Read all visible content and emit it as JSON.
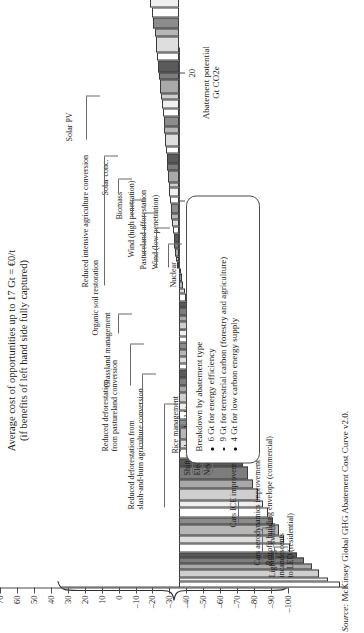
{
  "chart_data": {
    "type": "bar",
    "title": "Average cost of opportunities up to 17 Gt = €0/t",
    "subtitle": "(if benefits of left hand side fully captured)",
    "xlabel_line1": "Abatement potential",
    "xlabel_line2": "Gt CO2e",
    "ylabel": "",
    "orientation": "rotated-90-ccw",
    "xlim": [
      0,
      21
    ],
    "ylim": [
      -100,
      70
    ],
    "xticks": [
      10,
      15,
      20
    ],
    "xtick_labels": [
      "10",
      "15",
      "20"
    ],
    "yticks": [
      70,
      60,
      50,
      40,
      30,
      20,
      10,
      0,
      -10,
      -20,
      -30,
      -40,
      -50,
      -60,
      -70,
      -80,
      -90,
      -100
    ],
    "ytick_labels": [
      "70",
      "60",
      "50",
      "40",
      "30",
      "20",
      "10",
      "0",
      "–10",
      "–20",
      "–30",
      "–40",
      "–50",
      "–60",
      "–70",
      "–80",
      "–90",
      "–100"
    ],
    "grid": false,
    "legend_position": "inside-lower-right",
    "bars": [
      {
        "w": 0.22,
        "cost": -95
      },
      {
        "w": 0.18,
        "cost": -88
      },
      {
        "w": 0.3,
        "cost": -83
      },
      {
        "w": 0.22,
        "cost": -79
      },
      {
        "w": 0.26,
        "cost": -74
      },
      {
        "w": 0.2,
        "cost": -70
      },
      {
        "w": 0.34,
        "cost": -66
      },
      {
        "w": 0.3,
        "cost": -62
      },
      {
        "w": 0.44,
        "cost": -59
      },
      {
        "w": 0.26,
        "cost": -56
      },
      {
        "w": 0.38,
        "cost": -53
      },
      {
        "w": 0.3,
        "cost": -50
      },
      {
        "w": 0.46,
        "cost": -47
      },
      {
        "w": 0.34,
        "cost": -44
      },
      {
        "w": 0.52,
        "cost": -41
      },
      {
        "w": 0.3,
        "cost": -38
      },
      {
        "w": 0.4,
        "cost": -35
      },
      {
        "w": 0.34,
        "cost": -32
      },
      {
        "w": 0.48,
        "cost": -29
      },
      {
        "w": 0.3,
        "cost": -27
      },
      {
        "w": 0.36,
        "cost": -25
      },
      {
        "w": 0.28,
        "cost": -23
      },
      {
        "w": 0.4,
        "cost": -21
      },
      {
        "w": 0.26,
        "cost": -19
      },
      {
        "w": 0.34,
        "cost": -17
      },
      {
        "w": 0.3,
        "cost": -15.5
      },
      {
        "w": 0.22,
        "cost": -14
      },
      {
        "w": 0.3,
        "cost": -13
      },
      {
        "w": 0.24,
        "cost": -12
      },
      {
        "w": 0.3,
        "cost": -11
      },
      {
        "w": 0.22,
        "cost": -10
      },
      {
        "w": 0.26,
        "cost": -9
      },
      {
        "w": 0.34,
        "cost": -8
      },
      {
        "w": 0.22,
        "cost": -7
      },
      {
        "w": 0.3,
        "cost": -6
      },
      {
        "w": 0.24,
        "cost": -5
      },
      {
        "w": 0.3,
        "cost": -4.2
      },
      {
        "w": 0.22,
        "cost": -3.5
      },
      {
        "w": 0.26,
        "cost": -2.8
      },
      {
        "w": 0.3,
        "cost": -2.0
      },
      {
        "w": 0.2,
        "cost": -1.2
      },
      {
        "w": 0.26,
        "cost": 1.0
      },
      {
        "w": 0.22,
        "cost": 1.6
      },
      {
        "w": 0.3,
        "cost": 2.1
      },
      {
        "w": 0.24,
        "cost": 2.6
      },
      {
        "w": 0.34,
        "cost": 3.0
      },
      {
        "w": 0.26,
        "cost": 3.4
      },
      {
        "w": 0.3,
        "cost": 3.8
      },
      {
        "w": 0.22,
        "cost": 4.2
      },
      {
        "w": 0.4,
        "cost": 4.6
      },
      {
        "w": 0.26,
        "cost": 5.0
      },
      {
        "w": 0.34,
        "cost": 5.4
      },
      {
        "w": 0.22,
        "cost": 5.8
      },
      {
        "w": 0.46,
        "cost": 6.2
      },
      {
        "w": 0.28,
        "cost": 6.6
      },
      {
        "w": 0.36,
        "cost": 7.0
      },
      {
        "w": 0.3,
        "cost": 7.4
      },
      {
        "w": 0.5,
        "cost": 7.9
      },
      {
        "w": 0.26,
        "cost": 8.4
      },
      {
        "w": 0.4,
        "cost": 8.9
      },
      {
        "w": 0.3,
        "cost": 9.4
      },
      {
        "w": 0.34,
        "cost": 9.9
      },
      {
        "w": 0.26,
        "cost": 10.4
      },
      {
        "w": 0.52,
        "cost": 11.0
      },
      {
        "w": 0.3,
        "cost": 11.6
      },
      {
        "w": 0.44,
        "cost": 12.2
      },
      {
        "w": 0.34,
        "cost": 12.8
      },
      {
        "w": 0.6,
        "cost": 13.5
      },
      {
        "w": 0.3,
        "cost": 14.2
      },
      {
        "w": 0.46,
        "cost": 15.0
      },
      {
        "w": 0.36,
        "cost": 15.8
      },
      {
        "w": 0.7,
        "cost": 16.6
      },
      {
        "w": 0.34,
        "cost": 17.4
      },
      {
        "w": 0.56,
        "cost": 18.4
      },
      {
        "w": 0.4,
        "cost": 19.4
      },
      {
        "w": 0.8,
        "cost": 20.5
      },
      {
        "w": 0.44,
        "cost": 21.6
      },
      {
        "w": 0.62,
        "cost": 22.8
      },
      {
        "w": 0.38,
        "cost": 24.0
      },
      {
        "w": 0.9,
        "cost": 25.4
      },
      {
        "w": 0.44,
        "cost": 26.8
      },
      {
        "w": 1.05,
        "cost": 28.4
      },
      {
        "w": 0.4,
        "cost": 30.0
      },
      {
        "w": 0.74,
        "cost": 31.8
      },
      {
        "w": 0.36,
        "cost": 33.6
      },
      {
        "w": 0.58,
        "cost": 35.6
      },
      {
        "w": 0.3,
        "cost": 37.6
      },
      {
        "w": 0.46,
        "cost": 39.8
      },
      {
        "w": 0.28,
        "cost": 42.0
      },
      {
        "w": 0.36,
        "cost": 44.4
      },
      {
        "w": 0.24,
        "cost": 46.8
      },
      {
        "w": 0.34,
        "cost": 49.4
      },
      {
        "w": 0.22,
        "cost": 52.0
      },
      {
        "w": 0.28,
        "cost": 54.8
      },
      {
        "w": 0.2,
        "cost": 57.6
      },
      {
        "w": 0.26,
        "cost": 60.4
      },
      {
        "w": 0.18,
        "cost": 63.0
      },
      {
        "w": 0.22,
        "cost": 65.0
      },
      {
        "w": 0.16,
        "cost": 66.6
      }
    ]
  },
  "callouts": [
    {
      "id": "lighting-led",
      "text": [
        "Lighting –switch",
        "incandescents",
        "to LED (residential)"
      ]
    },
    {
      "id": "retrofit-building",
      "text": [
        "Retrofit building envelope (commercial)"
      ]
    },
    {
      "id": "cars-aero",
      "text": [
        "Cars aerodynamics improvement"
      ]
    },
    {
      "id": "cars-ice",
      "text": [
        "Cars ICE improvement"
      ]
    },
    {
      "id": "new-waste",
      "text": [
        "New waste recycling"
      ]
    },
    {
      "id": "landfill-gas",
      "text": [
        "Electricity from landfill gas"
      ]
    },
    {
      "id": "coal-to-gas",
      "text": [
        "Shift coal new build to gas"
      ]
    },
    {
      "id": "rice-management",
      "text": [
        "Rice management"
      ]
    },
    {
      "id": "reduced-defor-slash",
      "text": [
        "Reduced deforestation from",
        "slash-and-burn agriculture conversion"
      ]
    },
    {
      "id": "reduced-defor-past",
      "text": [
        "Reduced deforestation",
        "from pastureland conversion"
      ]
    },
    {
      "id": "grassland",
      "text": [
        "Grassland management"
      ]
    },
    {
      "id": "organic-soil",
      "text": [
        "Organic soil restoration"
      ]
    },
    {
      "id": "nuclear",
      "text": [
        "Nuclear"
      ]
    },
    {
      "id": "wind-low",
      "text": [
        "Wind (low penetration)"
      ]
    },
    {
      "id": "pastureland-affor",
      "text": [
        "Pastureland afforestation"
      ]
    },
    {
      "id": "wind-high",
      "text": [
        "Wind (high penetration)"
      ]
    },
    {
      "id": "biomass",
      "text": [
        "Biomass"
      ]
    },
    {
      "id": "solar-conc",
      "text": [
        "Solar conc."
      ]
    },
    {
      "id": "reduced-intensive",
      "text": [
        "Reduced intensive agriculture conversion"
      ]
    },
    {
      "id": "solar-pv",
      "text": [
        "Solar PV"
      ]
    }
  ],
  "legend": {
    "title": "Breakdown by abatement type",
    "items": [
      "6 Gt for energy efficiency",
      "9 Gt for terrestrial carbon (forestry and agriculture)",
      "4 Gt for low carbon energy supply"
    ]
  },
  "source": {
    "prefix": "Source:",
    "text": " McKinsey Global GHG Abatement Cost Curve v2.0."
  },
  "colors": {
    "axis": "#4a4a4a",
    "bar_stroke": "#3a3a3a",
    "text": "#1a1a1a"
  }
}
